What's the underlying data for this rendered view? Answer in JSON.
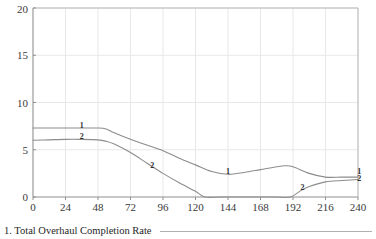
{
  "chart_data": {
    "type": "line",
    "title": "",
    "xlabel": "Months",
    "ylabel": "",
    "xlim": [
      0,
      240
    ],
    "ylim": [
      0,
      20
    ],
    "grid": true,
    "legend_position": "inline-labels",
    "x_ticks": [
      0,
      24,
      48,
      72,
      96,
      120,
      144,
      168,
      192,
      216,
      240
    ],
    "y_ticks": [
      0,
      5,
      10,
      15,
      20
    ],
    "series": [
      {
        "name": "1",
        "inline_label": "1",
        "color": "#8c8c8c",
        "x": [
          0,
          12,
          24,
          36,
          48,
          54,
          60,
          72,
          84,
          96,
          108,
          120,
          132,
          144,
          156,
          168,
          180,
          186,
          192,
          204,
          216,
          228,
          240
        ],
        "values": [
          7.3,
          7.3,
          7.3,
          7.3,
          7.3,
          7.2,
          6.8,
          6.1,
          5.5,
          4.9,
          4.1,
          3.4,
          2.7,
          2.4,
          2.6,
          2.9,
          3.2,
          3.3,
          3.2,
          2.5,
          2.1,
          2.1,
          2.1
        ]
      },
      {
        "name": "2",
        "inline_label": "2",
        "color": "#8c8c8c",
        "x": [
          0,
          12,
          24,
          36,
          48,
          54,
          60,
          72,
          84,
          96,
          108,
          120,
          127,
          138,
          156,
          168,
          180,
          190,
          198,
          204,
          216,
          228,
          240
        ],
        "values": [
          6.0,
          6.05,
          6.1,
          6.1,
          6.05,
          5.9,
          5.6,
          4.7,
          3.6,
          2.5,
          1.5,
          0.6,
          0.0,
          0.0,
          0.0,
          0.0,
          0.0,
          0.0,
          0.7,
          1.1,
          1.6,
          1.75,
          1.85
        ]
      }
    ],
    "annotations": [
      {
        "text": "1",
        "x": 36,
        "y": 7.3,
        "placement": "above-curve-1-plateau"
      },
      {
        "text": "2",
        "x": 36,
        "y": 6.1,
        "placement": "above-curve-2-plateau"
      },
      {
        "text": "2",
        "x": 88,
        "y": 3.1,
        "placement": "on-curve-2-descent"
      },
      {
        "text": "1",
        "x": 144,
        "y": 2.4,
        "placement": "at-curve-1-minimum"
      },
      {
        "text": "2",
        "x": 199,
        "y": 0.75,
        "placement": "on-curve-2-rise"
      },
      {
        "text": "1",
        "x": 241,
        "y": 2.4,
        "placement": "right-edge-curve-1"
      },
      {
        "text": "2",
        "x": 241,
        "y": 1.7,
        "placement": "right-edge-curve-2"
      }
    ]
  },
  "caption": {
    "text": "1. Total Overhaul Completion Rate"
  },
  "colors": {
    "curve": "#8c8c8c",
    "axis": "#909090",
    "grid": "#e8e8e8",
    "text": "#2b2b2b",
    "rule": "#b0b0b0"
  }
}
